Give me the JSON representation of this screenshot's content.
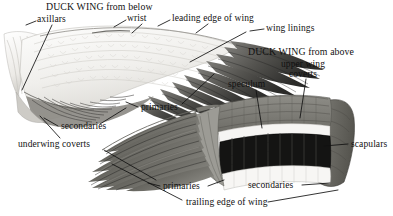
{
  "figure": {
    "kind": "labeled-anatomical-illustration",
    "subject": "Duck wing",
    "width": 393,
    "height": 216,
    "background_color": "#ffffff",
    "ink_color": "#111111"
  },
  "titles": {
    "below": "DUCK WING from below",
    "above": "DUCK WING from above"
  },
  "labels": {
    "axillars": "axillars",
    "wrist": "wrist",
    "leading_edge_of_wing": "leading edge of wing",
    "wing_linings": "wing linings",
    "upper_wing_line1": "upper wing",
    "upper_wing_line2": "coverts",
    "speculum": "speculum",
    "primaries_below": "primaries",
    "secondaries_below": "secondaries",
    "underwing_coverts": "underwing coverts",
    "primaries_above": "primaries",
    "secondaries_above": "secondaries",
    "trailing_edge_of_wing": "trailing edge of wing",
    "scapulars": "scapulars"
  },
  "palette": {
    "paper": "#ffffff",
    "underwing_light": "#f2f1ef",
    "underwing_shadow": "#d8d6d2",
    "primary_dark": "#4c4c4c",
    "primary_darker": "#2e2e2e",
    "upperwing_gray": "#7b7a76",
    "upperwing_mid": "#8d8c88",
    "speculum_black": "#111111",
    "white_bar": "#f7f7f5",
    "scapular_gray": "#6d6c68",
    "leader_line": "#111111"
  },
  "annotations": [
    {
      "name": "title-below",
      "text_key": "titles.below",
      "x": 46,
      "y": 2,
      "anchor": "left",
      "leader": null
    },
    {
      "name": "axillars",
      "text_key": "labels.axillars",
      "x": 37,
      "y": 15,
      "anchor": "left",
      "leader": {
        "x1": 35,
        "y1": 22,
        "x2": 16,
        "y2": 26
      }
    },
    {
      "name": "axillars-pointer",
      "text_key": null,
      "leader": {
        "x1": 50,
        "y1": 24,
        "x2": 24,
        "y2": 88
      }
    },
    {
      "name": "wrist",
      "text_key": "labels.wrist",
      "x": 127,
      "y": 13,
      "anchor": "left",
      "leader": {
        "x1": 125,
        "y1": 21,
        "x2": 100,
        "y2": 36
      }
    },
    {
      "name": "leading-edge-of-wing",
      "text_key": "labels.leading_edge_of_wing",
      "x": 172,
      "y": 13,
      "anchor": "left",
      "leader": {
        "x1": 170,
        "y1": 21,
        "x2": 148,
        "y2": 32
      }
    },
    {
      "name": "wing-linings",
      "text_key": "labels.wing_linings",
      "x": 266,
      "y": 23,
      "anchor": "left",
      "leader": {
        "x1": 264,
        "y1": 30,
        "x2": 214,
        "y2": 56
      }
    },
    {
      "name": "title-above",
      "text_key": "titles.above",
      "x": 248,
      "y": 47,
      "anchor": "left",
      "leader": null
    },
    {
      "name": "upper-wing-coverts",
      "text_key": "labels.upper_wing_line1",
      "x": 268,
      "y": 59,
      "anchor": "left",
      "leader": {
        "x1": 305,
        "y1": 79,
        "x2": 294,
        "y2": 117
      }
    },
    {
      "name": "speculum",
      "text_key": "labels.speculum",
      "x": 228,
      "y": 79,
      "anchor": "left",
      "leader": {
        "x1": 252,
        "y1": 90,
        "x2": 258,
        "y2": 124
      }
    },
    {
      "name": "primaries-below",
      "text_key": "labels.primaries_below",
      "x": 140,
      "y": 102,
      "anchor": "left",
      "leader": {
        "x1": 184,
        "y1": 103,
        "x2": 196,
        "y2": 86
      }
    },
    {
      "name": "primaries-below-lead2",
      "text_key": null,
      "leader": {
        "x1": 138,
        "y1": 107,
        "x2": 124,
        "y2": 100
      }
    },
    {
      "name": "secondaries-below",
      "text_key": "labels.secondaries_below",
      "x": 60,
      "y": 121,
      "anchor": "left",
      "leader": {
        "x1": 58,
        "y1": 126,
        "x2": 40,
        "y2": 112
      }
    },
    {
      "name": "underwing-coverts",
      "text_key": "labels.underwing_coverts",
      "x": 18,
      "y": 139,
      "anchor": "left",
      "leader": {
        "x1": 40,
        "y1": 137,
        "x2": 34,
        "y2": 118
      }
    },
    {
      "name": "primaries-above",
      "text_key": "labels.primaries_above",
      "x": 162,
      "y": 181,
      "anchor": "left",
      "leader": {
        "x1": 160,
        "y1": 186,
        "x2": 130,
        "y2": 148
      }
    },
    {
      "name": "secondaries-above",
      "text_key": "labels.secondaries_above",
      "x": 248,
      "y": 180,
      "anchor": "left",
      "leader": {
        "x1": 301,
        "y1": 185,
        "x2": 330,
        "y2": 181
      }
    },
    {
      "name": "trailing-edge-of-wing",
      "text_key": "labels.trailing_edge_of_wing",
      "x": 185,
      "y": 197,
      "anchor": "left",
      "leader": {
        "x1": 268,
        "y1": 202,
        "x2": 330,
        "y2": 190
      }
    },
    {
      "name": "scapulars",
      "text_key": "labels.scapulars",
      "x": 350,
      "y": 139,
      "anchor": "left",
      "leader": {
        "x1": 348,
        "y1": 145,
        "x2": 326,
        "y2": 145
      }
    }
  ]
}
